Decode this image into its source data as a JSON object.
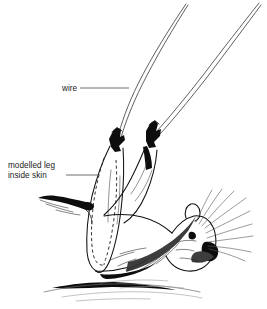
{
  "figure": {
    "kind": "line-art-illustration",
    "background_color": "#ffffff",
    "ink_color": "#111111",
    "width": 267,
    "height": 309,
    "annotations": [
      {
        "id": "wire",
        "label": "wire",
        "label_lines": [
          "wire"
        ],
        "text_x": 62,
        "text_y": 91,
        "leader": {
          "x1": 80,
          "y1": 88,
          "x2": 129,
          "y2": 88
        },
        "target": "support wire emerging from hind paw"
      },
      {
        "id": "modelled-leg-inside-skin",
        "label": "modelled leg inside skin",
        "label_lines": [
          "modelled leg",
          "inside skin"
        ],
        "text_x": 8,
        "text_y": 168,
        "line_height": 10,
        "leader": {
          "x1": 66,
          "y1": 175,
          "x2": 98,
          "y2": 175
        },
        "target": "dashed outline of the modelled leg form beneath the skin"
      }
    ],
    "elements": {
      "wires": [
        {
          "name": "wire-left",
          "top_x": 186,
          "entry_x": 117,
          "entry_y": 141
        },
        {
          "name": "wire-right",
          "top_x": 259,
          "entry_x": 156,
          "entry_y": 133
        }
      ],
      "dashed_leg_outline": "two nested dashed curves indicating the modelled leg core inside the skin",
      "whiskers_count": 9,
      "ground_lines_count": 6
    }
  }
}
